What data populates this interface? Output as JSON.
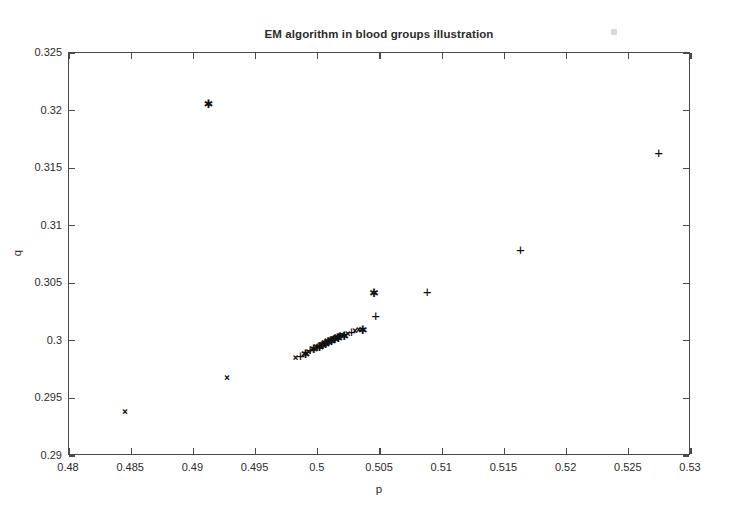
{
  "chart_data": {
    "type": "scatter",
    "title": "EM algorithm in blood groups illustration",
    "xlabel": "p",
    "ylabel": "q",
    "xlim": [
      0.48,
      0.53
    ],
    "ylim": [
      0.29,
      0.325
    ],
    "xticks": [
      0.48,
      0.485,
      0.49,
      0.495,
      0.5,
      0.505,
      0.51,
      0.515,
      0.52,
      0.525,
      0.53
    ],
    "yticks": [
      0.29,
      0.295,
      0.3,
      0.305,
      0.31,
      0.315,
      0.32,
      0.325
    ],
    "xticklabels": [
      "0.48",
      "0.485",
      "0.49",
      "0.495",
      "0.5",
      "0.505",
      "0.51",
      "0.515",
      "0.52",
      "0.525",
      "0.53"
    ],
    "yticklabels": [
      "0.29",
      "0.295",
      "0.3",
      "0.305",
      "0.31",
      "0.315",
      "0.32",
      "0.325"
    ],
    "grid": false,
    "legend": null,
    "background": "#ffffff",
    "marker_color": "#111111",
    "series": [
      {
        "name": "x-marks",
        "marker": "x",
        "glyph": "×",
        "points": [
          [
            0.4845,
            0.2938
          ],
          [
            0.4927,
            0.2968
          ],
          [
            0.4982,
            0.2985
          ],
          [
            0.49925,
            0.29905
          ],
          [
            0.49985,
            0.29945
          ],
          [
            0.5002,
            0.29965
          ],
          [
            0.5005,
            0.2998
          ],
          [
            0.50075,
            0.29995
          ],
          [
            0.50095,
            0.30005
          ],
          [
            0.50112,
            0.30012
          ],
          [
            0.50128,
            0.3002
          ],
          [
            0.50142,
            0.30026
          ],
          [
            0.50155,
            0.30032
          ],
          [
            0.50168,
            0.30038
          ],
          [
            0.5018,
            0.30043
          ],
          [
            0.50192,
            0.30048
          ],
          [
            0.5024,
            0.30062
          ],
          [
            0.503,
            0.30085
          ],
          [
            0.5033,
            0.30095
          ]
        ]
      },
      {
        "name": "asterisks",
        "marker": "*",
        "glyph": "✱",
        "points": [
          [
            0.4912,
            0.3207
          ],
          [
            0.5045,
            0.3042
          ],
          [
            0.5036,
            0.30105
          ],
          [
            0.5021,
            0.30052
          ],
          [
            0.50162,
            0.30035
          ],
          [
            0.50135,
            0.30023
          ],
          [
            0.50108,
            0.3001
          ],
          [
            0.50082,
            0.29998
          ],
          [
            0.5006,
            0.29985
          ],
          [
            0.50038,
            0.29972
          ],
          [
            0.50012,
            0.29958
          ],
          [
            0.49965,
            0.29935
          ],
          [
            0.499,
            0.29895
          ]
        ]
      },
      {
        "name": "plus-marks",
        "marker": "+",
        "glyph": "+",
        "points": [
          [
            0.5274,
            0.3163
          ],
          [
            0.5163,
            0.3079
          ],
          [
            0.5088,
            0.30425
          ],
          [
            0.50465,
            0.30215
          ],
          [
            0.5027,
            0.30075
          ],
          [
            0.50175,
            0.3004
          ],
          [
            0.50125,
            0.30018
          ],
          [
            0.5009,
            0.30002
          ],
          [
            0.50055,
            0.29982
          ],
          [
            0.50028,
            0.29966
          ],
          [
            0.49995,
            0.29948
          ],
          [
            0.4994,
            0.29918
          ],
          [
            0.4986,
            0.29872
          ]
        ]
      }
    ],
    "annotations": []
  }
}
